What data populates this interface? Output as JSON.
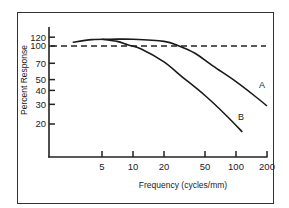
{
  "chart_data": {
    "type": "line",
    "title": "",
    "xlabel": "Frequency (cycles/mm)",
    "ylabel": "Percent Response",
    "x_scale": "log",
    "y_scale": "log",
    "x_ticks": [
      5,
      10,
      20,
      50,
      100,
      200
    ],
    "x_tick_labels": [
      "5",
      "10",
      "20",
      "50",
      "100",
      "200"
    ],
    "y_ticks": [
      20,
      30,
      40,
      50,
      70,
      100,
      120
    ],
    "y_tick_labels": [
      "20",
      "30",
      "40",
      "50",
      "70",
      "100",
      "120"
    ],
    "xlim": [
      1.2,
      200
    ],
    "ylim": [
      10,
      140
    ],
    "grid": false,
    "legend": "inline labels",
    "reference_line": {
      "y": 100,
      "style": "dashed"
    },
    "series": [
      {
        "name": "A",
        "x": [
          2.6,
          4,
          6,
          10,
          20,
          28,
          40,
          60,
          100,
          150,
          200
        ],
        "y": [
          108,
          114,
          115,
          115,
          110,
          100,
          86,
          66,
          48,
          36,
          29
        ]
      },
      {
        "name": "B",
        "x": [
          5,
          7,
          9,
          12,
          20,
          30,
          50,
          80,
          115
        ],
        "y": [
          115,
          110,
          102,
          94,
          72,
          53,
          36,
          24,
          17
        ]
      }
    ]
  }
}
